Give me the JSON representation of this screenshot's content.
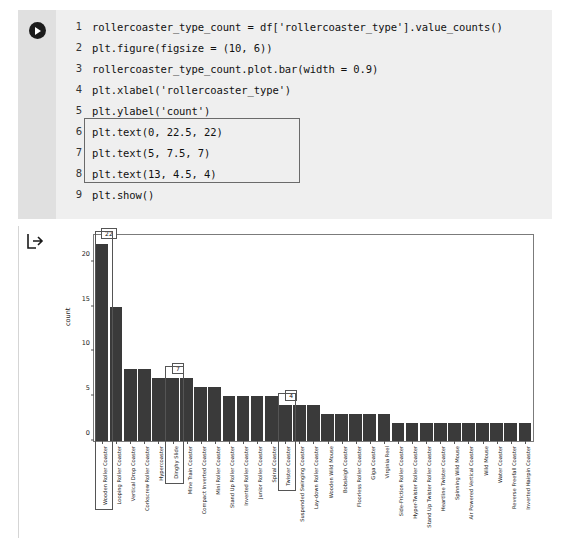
{
  "cell": {
    "run_icon": "play-icon",
    "lines": [
      {
        "n": "1",
        "code": "rollercoaster_type_count = df['rollercoaster_type'].value_counts()"
      },
      {
        "n": "2",
        "code": "plt.figure(figsize = (10, 6))"
      },
      {
        "n": "3",
        "code": "rollercoaster_type_count.plot.bar(width = 0.9)"
      },
      {
        "n": "4",
        "code": "plt.xlabel('rollercoaster_type')"
      },
      {
        "n": "5",
        "code": "plt.ylabel('count')"
      },
      {
        "n": "6",
        "code": "plt.text(0, 22.5, 22)"
      },
      {
        "n": "7",
        "code": "plt.text(5, 7.5, 7)"
      },
      {
        "n": "8",
        "code": "plt.text(13, 4.5, 4)"
      },
      {
        "n": "9",
        "code": "plt.show()"
      }
    ]
  },
  "output": {
    "arrow_icon": "output-arrow-icon"
  },
  "chart_data": {
    "type": "bar",
    "title": "",
    "xlabel": "rollercoaster_type",
    "ylabel": "count",
    "ylim": [
      0,
      23
    ],
    "yticks": [
      0,
      5,
      10,
      15,
      20
    ],
    "grid": false,
    "legend": false,
    "bar_color": "#3a3a3a",
    "categories": [
      "Wooden Roller Coaster",
      "Looping Roller Coaster",
      "Vertical Drop Coaster",
      "Corkscrew Roller Coaster",
      "Hypercoaster",
      "Dinghy Slide",
      "Mine Train Coaster",
      "Compact Inverted Coaster",
      "Mini Roller Coaster",
      "Stand Up Roller Coaster",
      "Inverted Roller Coaster",
      "Junior Roller Coaster",
      "Spiral Coaster",
      "Twister Coaster",
      "Suspended Swinging Coaster",
      "Lay-down Roller Coaster",
      "Wooden Wild Mouse",
      "Bobsleigh Coaster",
      "Floorless Roller Coaster",
      "Giga Coaster",
      "Virginia Reel",
      "Side-Friction Roller Coaster",
      "Hyper-Twister Roller Coaster",
      "Stand Up Twister Roller Coaster",
      "Heartline Twister Coaster",
      "Spinning Wild Mouse",
      "Air Powered Vertical Coaster",
      "Wild Mouse",
      "Water Coaster",
      "Reverse Freefall Coaster",
      "Inverted Hairpin Coaster"
    ],
    "values": [
      22,
      15,
      8,
      8,
      7,
      7,
      7,
      6,
      6,
      5,
      5,
      5,
      5,
      4,
      4,
      4,
      3,
      3,
      3,
      3,
      3,
      2,
      2,
      2,
      2,
      2,
      2,
      2,
      2,
      2,
      2
    ],
    "annotations": [
      {
        "label": "22",
        "index": 0,
        "y": 22.5
      },
      {
        "label": "7",
        "index": 5,
        "y": 7.5
      },
      {
        "label": "4",
        "index": 13,
        "y": 4.5
      }
    ],
    "highlighted_labels": [
      "Wooden Roller Coaster",
      "Dinghy Slide",
      "Twister Coaster"
    ]
  }
}
